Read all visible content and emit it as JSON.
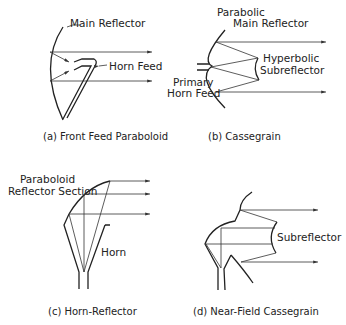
{
  "panels": [
    {
      "id": "a",
      "caption": "(a) Front Feed Paraboloid",
      "labels": [
        "Main Reflector",
        "Horn Feed"
      ]
    },
    {
      "id": "b",
      "caption": "(b) Cassegrain",
      "labels": [
        "Parabolic",
        "Main Reflector",
        "Hyperbolic",
        "Subreflector",
        "Primary",
        "Horn Feed"
      ]
    },
    {
      "id": "c",
      "caption": "(c) Horn-Reflector",
      "labels": [
        "Paraboloid",
        "Reflector Section",
        "Horn"
      ]
    },
    {
      "id": "d",
      "caption": "(d) Near-Field Cassegrain",
      "labels": [
        "Subreflector"
      ]
    }
  ],
  "colors": {
    "line": "#333333",
    "background": "#ffffff"
  }
}
